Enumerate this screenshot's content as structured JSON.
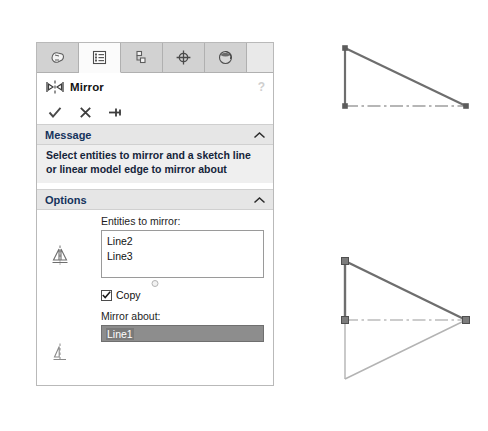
{
  "panel": {
    "tabs": [
      {
        "name": "feature-manager-design-tree",
        "icon": "tree-icon",
        "active": false
      },
      {
        "name": "property-manager",
        "icon": "property-list-icon",
        "active": true
      },
      {
        "name": "configuration-manager",
        "icon": "configuration-icon",
        "active": false
      },
      {
        "name": "dimxpert-manager",
        "icon": "dimxpert-target-icon",
        "active": false
      },
      {
        "name": "display-manager",
        "icon": "appearance-sphere-icon",
        "active": false
      }
    ],
    "title": "Mirror",
    "title_icon": "mirror-icon",
    "help_glyph": "?",
    "actions": [
      {
        "name": "accept-button",
        "icon": "check-icon",
        "glyph": "check"
      },
      {
        "name": "cancel-button",
        "icon": "close-icon",
        "glyph": "cross"
      },
      {
        "name": "pin-button",
        "icon": "pushpin-icon",
        "glyph": "pin"
      }
    ],
    "message": {
      "header": "Message",
      "collapse_glyph": "chevron-up",
      "text": "Select entities to mirror and a sketch line or linear model edge to mirror about"
    },
    "options": {
      "header": "Options",
      "collapse_glyph": "chevron-up",
      "entities_label": "Entities to mirror:",
      "entities": [
        "Line2",
        "Line3"
      ],
      "copy": {
        "label": "Copy",
        "checked": true
      },
      "mirror_about_label": "Mirror about:",
      "mirror_about_value": "Line1"
    }
  },
  "graphics": {
    "before": {
      "name": "original-sketch-triangle",
      "description": "right triangle with vertical left edge, hypotenuse, and centerline base",
      "points": {
        "top_left": [
          25,
          24
        ],
        "bottom_left": [
          25,
          82
        ],
        "bottom_right": [
          146,
          82
        ]
      }
    },
    "after": {
      "name": "mirrored-sketch-result",
      "description": "original triangle plus mirrored copy reflected about the horizontal centerline",
      "points": {
        "top_left": [
          25,
          237
        ],
        "mid_left": [
          25,
          296
        ],
        "right": [
          146,
          296
        ],
        "bottom_left": [
          25,
          355
        ]
      },
      "handles": 4
    }
  },
  "colors": {
    "panel_border": "#b9b9b9",
    "tab_inactive": "#d2d2d2",
    "tab_active": "#fbfbfb",
    "section_header": "#e6e6e6",
    "section_title": "#14335c",
    "message_body": "#efefef",
    "selected_field": "#8d8d8d",
    "sketch_original": "#6e6e6e",
    "sketch_mirrored": "#b3b3b3",
    "handle_fill": "#7c7c7c"
  }
}
